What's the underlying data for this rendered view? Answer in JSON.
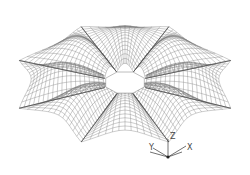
{
  "figure": {
    "lobe_count": 8,
    "opening_shape": "octagon",
    "line_color": "#6e6e6e",
    "background_color": "#ffffff"
  },
  "axis_triad": {
    "labels": {
      "x": "X",
      "y": "Y",
      "z": "Z"
    },
    "color": "#333333"
  }
}
